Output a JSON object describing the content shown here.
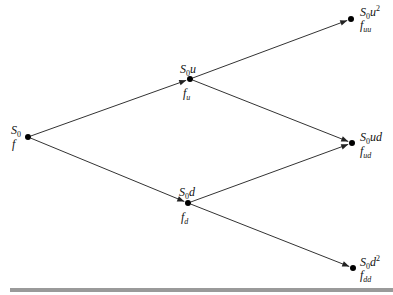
{
  "diagram": {
    "type": "binomial-tree",
    "steps": 2,
    "colors": {
      "line": "#333333",
      "node": "#000000",
      "rule": "#9a9a9a"
    },
    "nodes": [
      {
        "id": "root",
        "x": 28,
        "y": 137,
        "price": {
          "base": "S",
          "sub": "0",
          "tail": "",
          "sup": ""
        },
        "value": {
          "base": "f",
          "sub": ""
        }
      },
      {
        "id": "u",
        "x": 190,
        "y": 79,
        "price": {
          "base": "S",
          "sub": "0",
          "tail": "u",
          "sup": ""
        },
        "value": {
          "base": "f",
          "sub": "u"
        }
      },
      {
        "id": "d",
        "x": 188,
        "y": 203,
        "price": {
          "base": "S",
          "sub": "0",
          "tail": "d",
          "sup": ""
        },
        "value": {
          "base": "f",
          "sub": "d"
        }
      },
      {
        "id": "uu",
        "x": 351,
        "y": 19,
        "price": {
          "base": "S",
          "sub": "0",
          "tail": "u",
          "sup": "2"
        },
        "value": {
          "base": "f",
          "sub": "uu"
        }
      },
      {
        "id": "ud",
        "x": 352,
        "y": 143,
        "price": {
          "base": "S",
          "sub": "0",
          "tail": "ud",
          "sup": ""
        },
        "value": {
          "base": "f",
          "sub": "ud"
        }
      },
      {
        "id": "dd",
        "x": 353,
        "y": 268,
        "price": {
          "base": "S",
          "sub": "0",
          "tail": "d",
          "sup": "2"
        },
        "value": {
          "base": "f",
          "sub": "dd"
        }
      }
    ],
    "edges": [
      {
        "from": "root",
        "to": "u"
      },
      {
        "from": "root",
        "to": "d"
      },
      {
        "from": "u",
        "to": "uu"
      },
      {
        "from": "u",
        "to": "ud"
      },
      {
        "from": "d",
        "to": "ud"
      },
      {
        "from": "d",
        "to": "dd"
      }
    ]
  },
  "labels": {
    "root_price_base": "S",
    "root_price_sub": "0",
    "root_value": "f",
    "u_price_base": "S",
    "u_price_sub": "0",
    "u_price_tail": "u",
    "u_value_base": "f",
    "u_value_sub": "u",
    "d_price_base": "S",
    "d_price_sub": "0",
    "d_price_tail": "d",
    "d_value_base": "f",
    "d_value_sub": "d",
    "uu_price_base": "S",
    "uu_price_sub": "0",
    "uu_price_tail": "u",
    "uu_price_sup": "2",
    "uu_value_base": "f",
    "uu_value_sub": "uu",
    "ud_price_base": "S",
    "ud_price_sub": "0",
    "ud_price_tail": "ud",
    "ud_value_base": "f",
    "ud_value_sub": "ud",
    "dd_price_base": "S",
    "dd_price_sub": "0",
    "dd_price_tail": "d",
    "dd_price_sup": "2",
    "dd_value_base": "f",
    "dd_value_sub": "dd"
  }
}
